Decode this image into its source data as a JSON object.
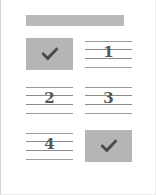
{
  "card": {
    "background_color": "#ffffff",
    "border_color": "#d8d8d8"
  },
  "header": {
    "label": "",
    "color": "#b9b9b9"
  },
  "grid": {
    "columns": 2,
    "rows": 3,
    "cells": [
      {
        "type": "check",
        "value": "✓",
        "background_color": "#b5b5b5",
        "mark_color": "#4a4a4a"
      },
      {
        "type": "ruled",
        "value": "1",
        "background_color": "#ffffff",
        "rule_color": "#8a8a8a"
      },
      {
        "type": "ruled",
        "value": "2",
        "background_color": "#ffffff",
        "rule_color": "#8a8a8a"
      },
      {
        "type": "ruled",
        "value": "3",
        "background_color": "#ffffff",
        "rule_color": "#8a8a8a"
      },
      {
        "type": "ruled",
        "value": "4",
        "background_color": "#ffffff",
        "rule_color": "#8a8a8a"
      },
      {
        "type": "check",
        "value": "✓",
        "background_color": "#b5b5b5",
        "mark_color": "#4a4a4a"
      }
    ]
  }
}
